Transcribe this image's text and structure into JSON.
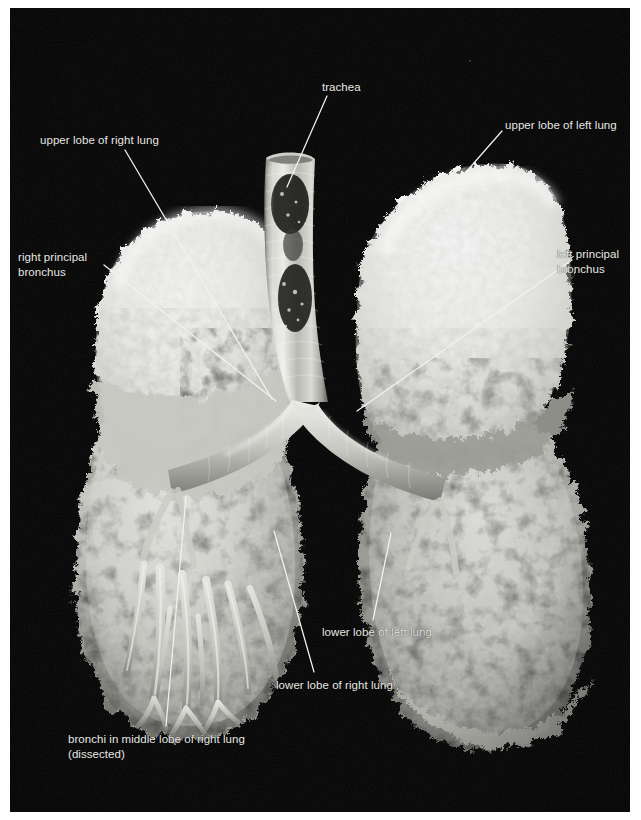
{
  "figure": {
    "kind": "anatomical-photograph",
    "background_color": "#020202",
    "page_color": "#ffffff",
    "label_color": "#e9e9e6",
    "leader_color": "#f2f2ee"
  },
  "labels": [
    {
      "id": "trachea",
      "text": "trachea",
      "x": 322,
      "y": 80,
      "align": "left",
      "leader": {
        "x1": 327,
        "y1": 96,
        "x2": 287,
        "y2": 187
      }
    },
    {
      "id": "upper-lobe-right-lung",
      "text": "upper lobe of right lung",
      "x": 40,
      "y": 133,
      "align": "left",
      "leader": {
        "x1": 125,
        "y1": 150,
        "x2": 272,
        "y2": 399
      }
    },
    {
      "id": "upper-lobe-left-lung",
      "text": "upper lobe of left lung",
      "x": 505,
      "y": 118,
      "align": "left",
      "leader": {
        "x1": 502,
        "y1": 131,
        "x2": 416,
        "y2": 229
      }
    },
    {
      "id": "right-principal-bronchus",
      "text": "right principal\nbronchus",
      "x": 18,
      "y": 250,
      "align": "left",
      "leader": {
        "x1": 104,
        "y1": 265,
        "x2": 276,
        "y2": 401
      }
    },
    {
      "id": "left-principal-bronchus",
      "text": "left principal\nbronchus",
      "x": 557,
      "y": 247,
      "align": "left",
      "leader": {
        "x1": 572,
        "y1": 260,
        "x2": 357,
        "y2": 411
      }
    },
    {
      "id": "lower-lobe-left-lung",
      "text": "lower lobe of left lung",
      "x": 322,
      "y": 625,
      "align": "left",
      "leader": {
        "x1": 373,
        "y1": 620,
        "x2": 391,
        "y2": 533
      }
    },
    {
      "id": "lower-lobe-right-lung",
      "text": "lower lobe of right lung",
      "x": 276,
      "y": 678,
      "align": "left",
      "leader": {
        "x1": 314,
        "y1": 672,
        "x2": 274,
        "y2": 531
      }
    },
    {
      "id": "bronchi-middle-lobe-right-lung",
      "text": "bronchi in middle lobe of right lung\n(dissected)",
      "x": 68,
      "y": 732,
      "align": "left",
      "leader": {
        "x1": 166,
        "y1": 726,
        "x2": 186,
        "y2": 497
      }
    }
  ],
  "structures": {
    "trachea_label": "trachea",
    "carina_label": "carina",
    "right_lung_label": "right lung",
    "left_lung_label": "left lung"
  }
}
